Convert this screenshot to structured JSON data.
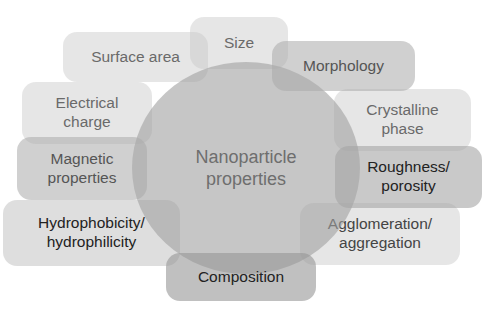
{
  "diagram": {
    "center": {
      "label_line1": "Nanoparticle",
      "label_line2": "properties"
    },
    "nodes": [
      {
        "id": "surface-area",
        "line1": "Surface area",
        "line2": ""
      },
      {
        "id": "size",
        "line1": "Size",
        "line2": ""
      },
      {
        "id": "morphology",
        "line1": "Morphology",
        "line2": ""
      },
      {
        "id": "electrical-charge",
        "line1": "Electrical",
        "line2": "charge"
      },
      {
        "id": "crystalline-phase",
        "line1": "Crystalline",
        "line2": "phase"
      },
      {
        "id": "magnetic-properties",
        "line1": "Magnetic",
        "line2": "properties"
      },
      {
        "id": "roughness-porosity",
        "line1": "Roughness/",
        "line2": "porosity"
      },
      {
        "id": "hydrophobicity",
        "line1": "Hydrophobicity/",
        "line2": "hydrophilicity"
      },
      {
        "id": "agglomeration",
        "line1": "Agglomeration/",
        "line2": "aggregation"
      },
      {
        "id": "composition",
        "line1": "Composition",
        "line2": ""
      }
    ],
    "colors": {
      "light": "#e4e4e4",
      "mid": "#cfcfcf",
      "dark": "#a8a8a8",
      "circle": "#b5b5b5"
    }
  }
}
